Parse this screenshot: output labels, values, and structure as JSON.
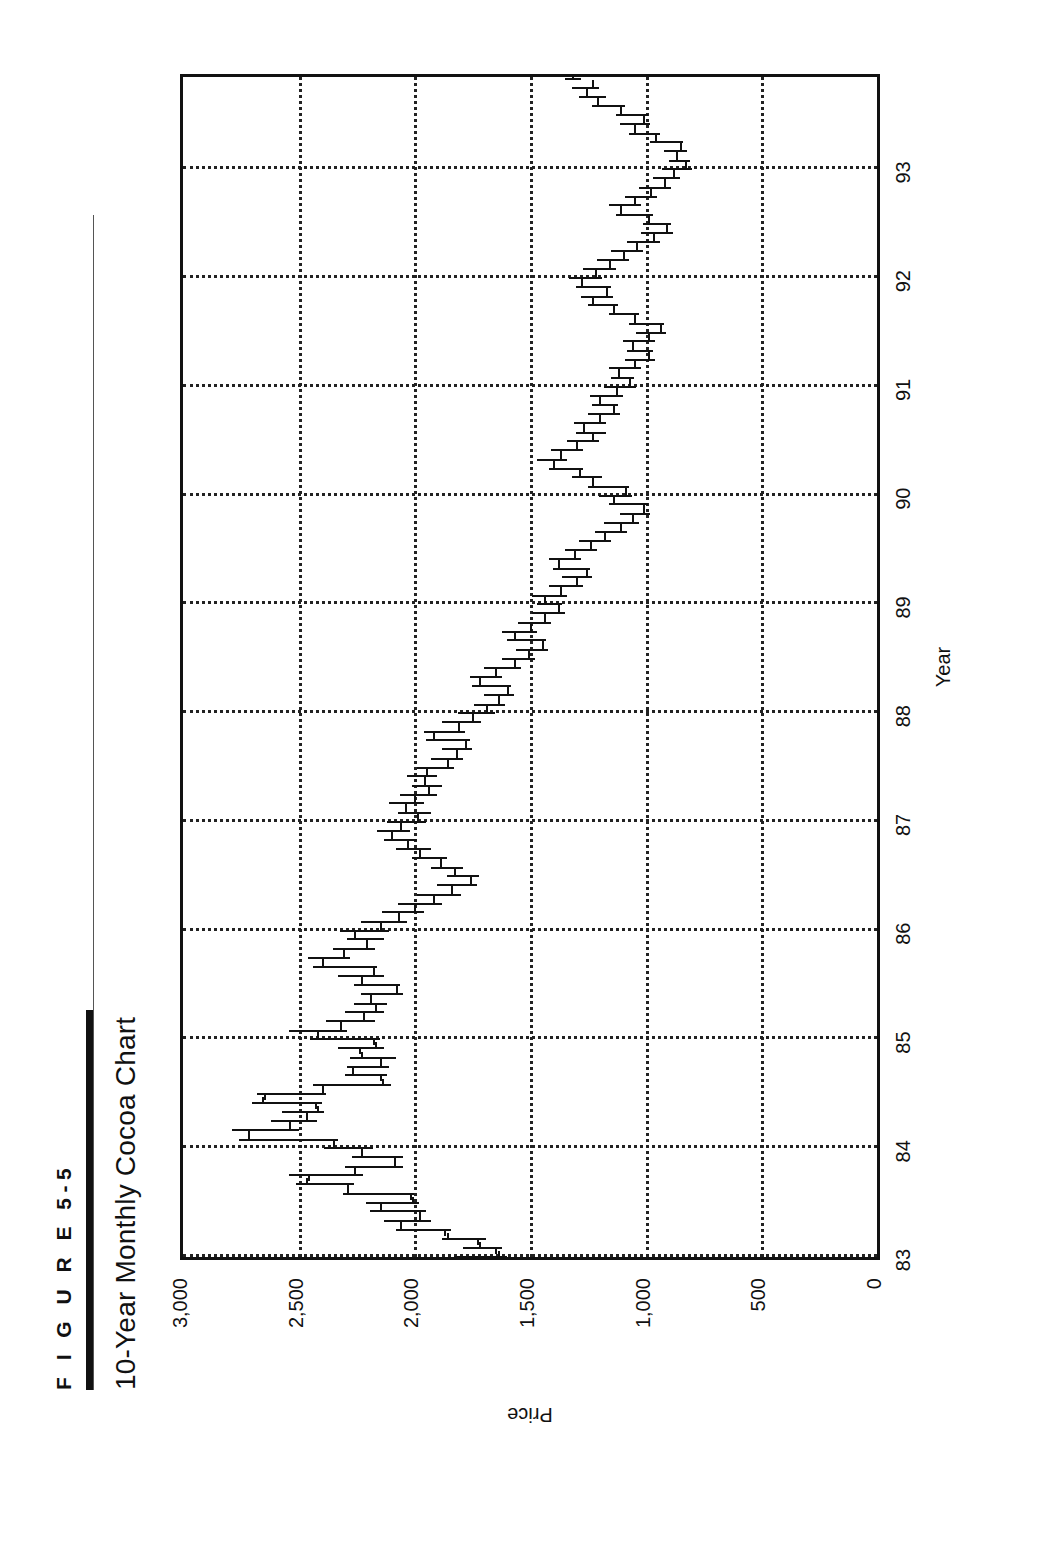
{
  "figure": {
    "label": "F I G U R E   5-5",
    "title": "10-Year Monthly Cocoa Chart"
  },
  "chart_data": {
    "type": "ohlc",
    "title": "10-Year Monthly Cocoa Chart",
    "xlabel": "Year",
    "ylabel": "Price",
    "xlim": [
      1983.0,
      1993.85
    ],
    "ylim": [
      0,
      3000
    ],
    "ytick_labels": [
      "3,000",
      "2,500",
      "2,000",
      "1,500",
      "1,000",
      "500",
      "0"
    ],
    "yticks": [
      3000,
      2500,
      2000,
      1500,
      1000,
      500,
      0
    ],
    "xtick_labels": [
      "83",
      "84",
      "85",
      "86",
      "87",
      "88",
      "89",
      "90",
      "91",
      "92",
      "93"
    ],
    "xticks": [
      1983,
      1984,
      1985,
      1986,
      1987,
      1988,
      1989,
      1990,
      1991,
      1992,
      1993
    ],
    "grid": "dotted",
    "legend": "none",
    "series_name": "Cocoa monthly OHLC",
    "bars": [
      {
        "t": 1983.0,
        "o": 1800,
        "h": 1830,
        "l": 1600,
        "c": 1640
      },
      {
        "t": 1983.08,
        "o": 1650,
        "h": 1790,
        "l": 1620,
        "c": 1720
      },
      {
        "t": 1983.17,
        "o": 1730,
        "h": 1880,
        "l": 1690,
        "c": 1860
      },
      {
        "t": 1983.25,
        "o": 1870,
        "h": 2080,
        "l": 1840,
        "c": 2060
      },
      {
        "t": 1983.33,
        "o": 2060,
        "h": 2130,
        "l": 1930,
        "c": 1980
      },
      {
        "t": 1983.42,
        "o": 1980,
        "h": 2190,
        "l": 1950,
        "c": 2150
      },
      {
        "t": 1983.5,
        "o": 2150,
        "h": 2210,
        "l": 1980,
        "c": 2010
      },
      {
        "t": 1983.58,
        "o": 2020,
        "h": 2310,
        "l": 2000,
        "c": 2290
      },
      {
        "t": 1983.67,
        "o": 2290,
        "h": 2510,
        "l": 2260,
        "c": 2470
      },
      {
        "t": 1983.75,
        "o": 2460,
        "h": 2540,
        "l": 2220,
        "c": 2260
      },
      {
        "t": 1983.83,
        "o": 2260,
        "h": 2300,
        "l": 2050,
        "c": 2090
      },
      {
        "t": 1983.92,
        "o": 2090,
        "h": 2270,
        "l": 2050,
        "c": 2230
      },
      {
        "t": 1984.0,
        "o": 2230,
        "h": 2390,
        "l": 2180,
        "c": 2350
      },
      {
        "t": 1984.08,
        "o": 2350,
        "h": 2760,
        "l": 2330,
        "c": 2720
      },
      {
        "t": 1984.17,
        "o": 2720,
        "h": 2790,
        "l": 2500,
        "c": 2540
      },
      {
        "t": 1984.25,
        "o": 2540,
        "h": 2620,
        "l": 2420,
        "c": 2470
      },
      {
        "t": 1984.33,
        "o": 2470,
        "h": 2570,
        "l": 2390,
        "c": 2420
      },
      {
        "t": 1984.42,
        "o": 2430,
        "h": 2700,
        "l": 2400,
        "c": 2660
      },
      {
        "t": 1984.5,
        "o": 2650,
        "h": 2680,
        "l": 2380,
        "c": 2400
      },
      {
        "t": 1984.58,
        "o": 2400,
        "h": 2440,
        "l": 2100,
        "c": 2140
      },
      {
        "t": 1984.67,
        "o": 2150,
        "h": 2300,
        "l": 2120,
        "c": 2270
      },
      {
        "t": 1984.75,
        "o": 2270,
        "h": 2290,
        "l": 2110,
        "c": 2150
      },
      {
        "t": 1984.83,
        "o": 2150,
        "h": 2280,
        "l": 2080,
        "c": 2230
      },
      {
        "t": 1984.92,
        "o": 2240,
        "h": 2330,
        "l": 2130,
        "c": 2170
      },
      {
        "t": 1985.0,
        "o": 2180,
        "h": 2450,
        "l": 2150,
        "c": 2420
      },
      {
        "t": 1985.08,
        "o": 2420,
        "h": 2540,
        "l": 2290,
        "c": 2320
      },
      {
        "t": 1985.17,
        "o": 2320,
        "h": 2380,
        "l": 2170,
        "c": 2220
      },
      {
        "t": 1985.25,
        "o": 2220,
        "h": 2300,
        "l": 2130,
        "c": 2170
      },
      {
        "t": 1985.33,
        "o": 2170,
        "h": 2260,
        "l": 2120,
        "c": 2190
      },
      {
        "t": 1985.42,
        "o": 2190,
        "h": 2230,
        "l": 2050,
        "c": 2080
      },
      {
        "t": 1985.5,
        "o": 2080,
        "h": 2260,
        "l": 2060,
        "c": 2230
      },
      {
        "t": 1985.58,
        "o": 2230,
        "h": 2330,
        "l": 2130,
        "c": 2180
      },
      {
        "t": 1985.67,
        "o": 2180,
        "h": 2440,
        "l": 2160,
        "c": 2400
      },
      {
        "t": 1985.75,
        "o": 2400,
        "h": 2460,
        "l": 2280,
        "c": 2310
      },
      {
        "t": 1985.83,
        "o": 2310,
        "h": 2350,
        "l": 2170,
        "c": 2210
      },
      {
        "t": 1985.92,
        "o": 2210,
        "h": 2290,
        "l": 2130,
        "c": 2260
      },
      {
        "t": 1986.0,
        "o": 2260,
        "h": 2320,
        "l": 2110,
        "c": 2150
      },
      {
        "t": 1986.08,
        "o": 2150,
        "h": 2230,
        "l": 2030,
        "c": 2070
      },
      {
        "t": 1986.17,
        "o": 2070,
        "h": 2140,
        "l": 1960,
        "c": 2000
      },
      {
        "t": 1986.25,
        "o": 2000,
        "h": 2070,
        "l": 1880,
        "c": 1920
      },
      {
        "t": 1986.33,
        "o": 1920,
        "h": 1990,
        "l": 1800,
        "c": 1840
      },
      {
        "t": 1986.42,
        "o": 1840,
        "h": 1900,
        "l": 1730,
        "c": 1760
      },
      {
        "t": 1986.5,
        "o": 1760,
        "h": 1860,
        "l": 1720,
        "c": 1830
      },
      {
        "t": 1986.58,
        "o": 1830,
        "h": 1930,
        "l": 1790,
        "c": 1890
      },
      {
        "t": 1986.67,
        "o": 1890,
        "h": 2010,
        "l": 1860,
        "c": 1980
      },
      {
        "t": 1986.75,
        "o": 1980,
        "h": 2080,
        "l": 1930,
        "c": 2030
      },
      {
        "t": 1986.83,
        "o": 2030,
        "h": 2130,
        "l": 1990,
        "c": 2100
      },
      {
        "t": 1986.92,
        "o": 2100,
        "h": 2160,
        "l": 2020,
        "c": 2060
      },
      {
        "t": 1987.0,
        "o": 2060,
        "h": 2120,
        "l": 1950,
        "c": 1990
      },
      {
        "t": 1987.08,
        "o": 1990,
        "h": 2070,
        "l": 1930,
        "c": 2040
      },
      {
        "t": 1987.17,
        "o": 2040,
        "h": 2110,
        "l": 1960,
        "c": 2000
      },
      {
        "t": 1987.25,
        "o": 2000,
        "h": 2060,
        "l": 1900,
        "c": 1940
      },
      {
        "t": 1987.33,
        "o": 1940,
        "h": 2010,
        "l": 1880,
        "c": 1960
      },
      {
        "t": 1987.42,
        "o": 1960,
        "h": 2030,
        "l": 1900,
        "c": 1950
      },
      {
        "t": 1987.5,
        "o": 1950,
        "h": 1990,
        "l": 1830,
        "c": 1860
      },
      {
        "t": 1987.58,
        "o": 1860,
        "h": 1930,
        "l": 1790,
        "c": 1820
      },
      {
        "t": 1987.67,
        "o": 1820,
        "h": 1880,
        "l": 1750,
        "c": 1780
      },
      {
        "t": 1987.75,
        "o": 1780,
        "h": 1950,
        "l": 1760,
        "c": 1920
      },
      {
        "t": 1987.83,
        "o": 1920,
        "h": 1960,
        "l": 1780,
        "c": 1810
      },
      {
        "t": 1987.92,
        "o": 1810,
        "h": 1880,
        "l": 1710,
        "c": 1750
      },
      {
        "t": 1988.0,
        "o": 1750,
        "h": 1810,
        "l": 1650,
        "c": 1690
      },
      {
        "t": 1988.08,
        "o": 1690,
        "h": 1740,
        "l": 1610,
        "c": 1640
      },
      {
        "t": 1988.17,
        "o": 1640,
        "h": 1700,
        "l": 1570,
        "c": 1600
      },
      {
        "t": 1988.25,
        "o": 1600,
        "h": 1750,
        "l": 1580,
        "c": 1720
      },
      {
        "t": 1988.33,
        "o": 1720,
        "h": 1760,
        "l": 1620,
        "c": 1650
      },
      {
        "t": 1988.42,
        "o": 1650,
        "h": 1700,
        "l": 1540,
        "c": 1570
      },
      {
        "t": 1988.5,
        "o": 1570,
        "h": 1620,
        "l": 1480,
        "c": 1510
      },
      {
        "t": 1988.58,
        "o": 1510,
        "h": 1560,
        "l": 1420,
        "c": 1450
      },
      {
        "t": 1988.67,
        "o": 1450,
        "h": 1600,
        "l": 1430,
        "c": 1570
      },
      {
        "t": 1988.75,
        "o": 1570,
        "h": 1620,
        "l": 1470,
        "c": 1500
      },
      {
        "t": 1988.83,
        "o": 1500,
        "h": 1550,
        "l": 1410,
        "c": 1440
      },
      {
        "t": 1988.92,
        "o": 1440,
        "h": 1490,
        "l": 1350,
        "c": 1380
      },
      {
        "t": 1989.0,
        "o": 1380,
        "h": 1470,
        "l": 1360,
        "c": 1440
      },
      {
        "t": 1989.08,
        "o": 1440,
        "h": 1490,
        "l": 1340,
        "c": 1370
      },
      {
        "t": 1989.17,
        "o": 1370,
        "h": 1420,
        "l": 1270,
        "c": 1300
      },
      {
        "t": 1989.25,
        "o": 1300,
        "h": 1360,
        "l": 1230,
        "c": 1260
      },
      {
        "t": 1989.33,
        "o": 1260,
        "h": 1400,
        "l": 1240,
        "c": 1380
      },
      {
        "t": 1989.42,
        "o": 1380,
        "h": 1420,
        "l": 1280,
        "c": 1310
      },
      {
        "t": 1989.5,
        "o": 1310,
        "h": 1350,
        "l": 1210,
        "c": 1240
      },
      {
        "t": 1989.58,
        "o": 1240,
        "h": 1290,
        "l": 1150,
        "c": 1180
      },
      {
        "t": 1989.67,
        "o": 1180,
        "h": 1220,
        "l": 1080,
        "c": 1110
      },
      {
        "t": 1989.75,
        "o": 1110,
        "h": 1180,
        "l": 1030,
        "c": 1060
      },
      {
        "t": 1989.83,
        "o": 1060,
        "h": 1110,
        "l": 980,
        "c": 1010
      },
      {
        "t": 1989.92,
        "o": 1010,
        "h": 1160,
        "l": 990,
        "c": 1140
      },
      {
        "t": 1990.0,
        "o": 1140,
        "h": 1200,
        "l": 1060,
        "c": 1090
      },
      {
        "t": 1990.08,
        "o": 1090,
        "h": 1250,
        "l": 1070,
        "c": 1230
      },
      {
        "t": 1990.17,
        "o": 1230,
        "h": 1320,
        "l": 1190,
        "c": 1290
      },
      {
        "t": 1990.25,
        "o": 1290,
        "h": 1420,
        "l": 1270,
        "c": 1400
      },
      {
        "t": 1990.33,
        "o": 1400,
        "h": 1470,
        "l": 1340,
        "c": 1370
      },
      {
        "t": 1990.42,
        "o": 1370,
        "h": 1410,
        "l": 1270,
        "c": 1300
      },
      {
        "t": 1990.5,
        "o": 1300,
        "h": 1340,
        "l": 1200,
        "c": 1230
      },
      {
        "t": 1990.58,
        "o": 1230,
        "h": 1300,
        "l": 1170,
        "c": 1270
      },
      {
        "t": 1990.67,
        "o": 1270,
        "h": 1310,
        "l": 1170,
        "c": 1200
      },
      {
        "t": 1990.75,
        "o": 1200,
        "h": 1250,
        "l": 1110,
        "c": 1140
      },
      {
        "t": 1990.83,
        "o": 1140,
        "h": 1230,
        "l": 1120,
        "c": 1200
      },
      {
        "t": 1990.92,
        "o": 1200,
        "h": 1240,
        "l": 1100,
        "c": 1130
      },
      {
        "t": 1991.0,
        "o": 1130,
        "h": 1180,
        "l": 1040,
        "c": 1070
      },
      {
        "t": 1991.08,
        "o": 1070,
        "h": 1150,
        "l": 1050,
        "c": 1120
      },
      {
        "t": 1991.17,
        "o": 1120,
        "h": 1160,
        "l": 1020,
        "c": 1050
      },
      {
        "t": 1991.25,
        "o": 1050,
        "h": 1090,
        "l": 960,
        "c": 990
      },
      {
        "t": 1991.33,
        "o": 990,
        "h": 1080,
        "l": 970,
        "c": 1060
      },
      {
        "t": 1991.42,
        "o": 1060,
        "h": 1100,
        "l": 960,
        "c": 990
      },
      {
        "t": 1991.5,
        "o": 990,
        "h": 1040,
        "l": 910,
        "c": 940
      },
      {
        "t": 1991.58,
        "o": 940,
        "h": 1070,
        "l": 920,
        "c": 1050
      },
      {
        "t": 1991.67,
        "o": 1050,
        "h": 1160,
        "l": 1030,
        "c": 1140
      },
      {
        "t": 1991.75,
        "o": 1140,
        "h": 1250,
        "l": 1120,
        "c": 1230
      },
      {
        "t": 1991.83,
        "o": 1230,
        "h": 1280,
        "l": 1140,
        "c": 1170
      },
      {
        "t": 1991.92,
        "o": 1170,
        "h": 1300,
        "l": 1150,
        "c": 1280
      },
      {
        "t": 1992.0,
        "o": 1280,
        "h": 1330,
        "l": 1190,
        "c": 1220
      },
      {
        "t": 1992.08,
        "o": 1220,
        "h": 1270,
        "l": 1130,
        "c": 1160
      },
      {
        "t": 1992.17,
        "o": 1160,
        "h": 1210,
        "l": 1070,
        "c": 1100
      },
      {
        "t": 1992.25,
        "o": 1100,
        "h": 1150,
        "l": 1010,
        "c": 1040
      },
      {
        "t": 1992.33,
        "o": 1040,
        "h": 1080,
        "l": 940,
        "c": 970
      },
      {
        "t": 1992.42,
        "o": 970,
        "h": 1020,
        "l": 880,
        "c": 910
      },
      {
        "t": 1992.5,
        "o": 910,
        "h": 1010,
        "l": 890,
        "c": 990
      },
      {
        "t": 1992.58,
        "o": 990,
        "h": 1130,
        "l": 970,
        "c": 1110
      },
      {
        "t": 1992.67,
        "o": 1110,
        "h": 1160,
        "l": 1020,
        "c": 1050
      },
      {
        "t": 1992.75,
        "o": 1050,
        "h": 1090,
        "l": 950,
        "c": 980
      },
      {
        "t": 1992.83,
        "o": 980,
        "h": 1030,
        "l": 890,
        "c": 920
      },
      {
        "t": 1992.92,
        "o": 920,
        "h": 970,
        "l": 850,
        "c": 880
      },
      {
        "t": 1993.0,
        "o": 880,
        "h": 930,
        "l": 800,
        "c": 830
      },
      {
        "t": 1993.08,
        "o": 830,
        "h": 900,
        "l": 810,
        "c": 870
      },
      {
        "t": 1993.17,
        "o": 870,
        "h": 920,
        "l": 820,
        "c": 850
      },
      {
        "t": 1993.25,
        "o": 850,
        "h": 980,
        "l": 840,
        "c": 960
      },
      {
        "t": 1993.33,
        "o": 960,
        "h": 1070,
        "l": 940,
        "c": 1050
      },
      {
        "t": 1993.42,
        "o": 1050,
        "h": 1110,
        "l": 980,
        "c": 1010
      },
      {
        "t": 1993.5,
        "o": 1010,
        "h": 1130,
        "l": 990,
        "c": 1110
      },
      {
        "t": 1993.58,
        "o": 1110,
        "h": 1230,
        "l": 1090,
        "c": 1210
      },
      {
        "t": 1993.67,
        "o": 1210,
        "h": 1290,
        "l": 1170,
        "c": 1260
      },
      {
        "t": 1993.75,
        "o": 1260,
        "h": 1320,
        "l": 1200,
        "c": 1230
      },
      {
        "t": 1993.83,
        "o": 1230,
        "h": 1350,
        "l": 1280,
        "c": 1320
      }
    ]
  }
}
